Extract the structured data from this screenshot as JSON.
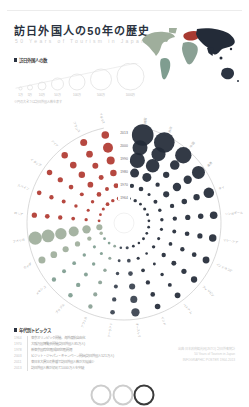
{
  "page": {
    "title": "訪日外国人の50年の歴史",
    "subtitle": "50 Years of Tourism in Japan"
  },
  "bubble_legend": {
    "label": "訪日外国人の数",
    "note": "※円の大きさは訪日外国人数を表す",
    "sizes": [
      {
        "label": "1万",
        "r": 1.5
      },
      {
        "label": "5万",
        "r": 2.5
      },
      {
        "label": "10万",
        "r": 4
      },
      {
        "label": "50万",
        "r": 6
      },
      {
        "label": "100万",
        "r": 8
      },
      {
        "label": "500万",
        "r": 10.5
      },
      {
        "label": "1000万",
        "r": 13.5
      }
    ]
  },
  "map": {
    "continents": [
      {
        "name": "north-america",
        "color": "#9fae9c"
      },
      {
        "name": "south-america",
        "color": "#7f9d90"
      },
      {
        "name": "europe",
        "color": "#a83a31"
      },
      {
        "name": "africa",
        "color": "#8aa094"
      },
      {
        "name": "asia",
        "color": "#232b38"
      },
      {
        "name": "oceania",
        "color": "#2c3442"
      }
    ]
  },
  "chart_data": {
    "type": "radial-bubble",
    "title": "訪日外国人の50年の歴史",
    "unit": "万人",
    "years": [
      "1964",
      "1970",
      "1980",
      "1990",
      "2000",
      "2013"
    ],
    "legend_position": "top-left",
    "continent_colors": {
      "asia": "#232b38",
      "oceania": "#39424f",
      "americas": "#9fae9c",
      "south_america": "#7f9d90",
      "europe": "#b03a31",
      "africa": "#8aa094"
    },
    "series": [
      {
        "name": "韓国",
        "continent": "asia",
        "values": [
          0.5,
          3,
          30,
          110,
          106,
          246
        ]
      },
      {
        "name": "台湾",
        "continent": "asia",
        "values": [
          1,
          4,
          30,
          85,
          91,
          221
        ]
      },
      {
        "name": "中国",
        "continent": "asia",
        "values": [
          0.2,
          0.5,
          3,
          11,
          35,
          131
        ]
      },
      {
        "name": "香港",
        "continent": "asia",
        "values": [
          0.5,
          2,
          10,
          25,
          24,
          75
        ]
      },
      {
        "name": "タイ",
        "continent": "asia",
        "values": [
          0.3,
          1,
          3,
          7,
          11,
          45
        ]
      },
      {
        "name": "シンガポール",
        "continent": "asia",
        "values": [
          0.2,
          1,
          3,
          6,
          7,
          19
        ]
      },
      {
        "name": "マレーシア",
        "continent": "asia",
        "values": [
          0.2,
          0.5,
          2,
          4,
          6,
          18
        ]
      },
      {
        "name": "インドネシア",
        "continent": "asia",
        "values": [
          0.2,
          0.5,
          1.5,
          3,
          4,
          14
        ]
      },
      {
        "name": "フィリピン",
        "continent": "asia",
        "values": [
          0.3,
          1,
          3,
          5,
          6,
          11
        ]
      },
      {
        "name": "ベトナム",
        "continent": "asia",
        "values": [
          0.05,
          0.1,
          0.3,
          1,
          2,
          8
        ]
      },
      {
        "name": "インド",
        "continent": "asia",
        "values": [
          0.2,
          0.5,
          1.5,
          3,
          4,
          7.5
        ]
      },
      {
        "name": "オーストラリア",
        "continent": "oceania",
        "values": [
          0.5,
          1.5,
          4,
          10,
          15,
          24
        ]
      },
      {
        "name": "ニュージーランド",
        "continent": "oceania",
        "values": [
          0.1,
          0.3,
          1,
          2,
          3,
          4
        ]
      },
      {
        "name": "アフリカ",
        "continent": "africa",
        "values": [
          0.2,
          0.5,
          1,
          2,
          2.5,
          3
        ]
      },
      {
        "name": "ブラジル",
        "continent": "south_america",
        "values": [
          0.2,
          0.5,
          1,
          2,
          3,
          3.5
        ]
      },
      {
        "name": "メキシコ",
        "continent": "south_america",
        "values": [
          0.2,
          0.5,
          1,
          1.5,
          2,
          3
        ]
      },
      {
        "name": "カナダ",
        "continent": "americas",
        "values": [
          1,
          3,
          6,
          10,
          13,
          15
        ]
      },
      {
        "name": "アメリカ",
        "continent": "americas",
        "values": [
          10,
          25,
          40,
          55,
          72,
          80
        ]
      },
      {
        "name": "ロシア",
        "continent": "europe",
        "values": [
          0.3,
          0.8,
          1.5,
          3,
          4,
          6
        ]
      },
      {
        "name": "スペイン",
        "continent": "europe",
        "values": [
          0.2,
          0.5,
          1,
          2,
          3,
          4
        ]
      },
      {
        "name": "イタリア",
        "continent": "europe",
        "values": [
          0.5,
          1,
          2,
          4,
          6,
          7
        ]
      },
      {
        "name": "ドイツ",
        "continent": "europe",
        "values": [
          1.5,
          4,
          8,
          12,
          13,
          12
        ]
      },
      {
        "name": "フランス",
        "continent": "europe",
        "values": [
          1,
          2,
          5,
          9,
          13,
          15
        ]
      },
      {
        "name": "イギリス",
        "continent": "europe",
        "values": [
          2,
          5,
          12,
          22,
          39,
          19
        ]
      }
    ]
  },
  "topics": {
    "label": "年代別トピックス",
    "items": [
      {
        "year": "1964",
        "text": "東京オリンピック開催、海外渡航自由化"
      },
      {
        "year": "1970",
        "text": "大阪万国博覧会開催(訪日外国人85万人)"
      },
      {
        "year": "1978",
        "text": "新東京国際空港(成田空港)開港"
      },
      {
        "year": "2003",
        "text": "ビジット・ジャパン・キャンペーン開始(訪日外国人521万人)"
      },
      {
        "year": "2011",
        "text": "東日本大震災の影響で訪日外国人数が大幅減少"
      },
      {
        "year": "2013",
        "text": "訪日外国人数が初めて1000万人を突破"
      }
    ]
  },
  "credits": {
    "lines": [
      "出典:日本政府観光局(JNTO) 訪日外客統計",
      "50 Years of Tourism in Japan",
      "INFOGRAPHIC POSTER 1964-2013"
    ]
  },
  "olympic_rings": {
    "colors": [
      "#cccccc",
      "#cccccc",
      "#3a3a3a"
    ]
  }
}
